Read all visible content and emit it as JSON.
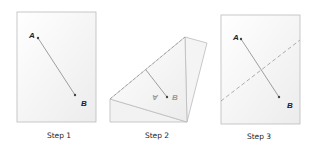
{
  "steps": [
    {
      "caption": "Step 1",
      "point_a": "A",
      "point_b": "B"
    },
    {
      "caption": "Step 2",
      "point_a": "A",
      "point_b": "B"
    },
    {
      "caption": "Step 3",
      "point_a": "A",
      "point_b": "B"
    }
  ],
  "colors": {
    "paper_border": "#bbbbbb",
    "segment": "#888888",
    "fold": "#999999",
    "point": "#444444"
  }
}
